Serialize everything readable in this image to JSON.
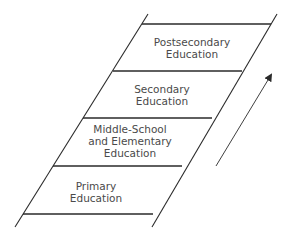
{
  "diagram": {
    "type": "ladder",
    "direction": "upward",
    "stroke_color": "#2a2a2a",
    "text_color": "#4a4a4a",
    "rungs": [
      {
        "label": "Postsecondary\nEducation",
        "level": 4
      },
      {
        "label": "Secondary\nEducation",
        "level": 3
      },
      {
        "label": "Middle-School\nand Elementary\nEducation",
        "level": 2
      },
      {
        "label": "Primary\nEducation",
        "level": 1
      }
    ],
    "arrow": {
      "meaning": "progression upward",
      "icon": "arrow-up-right-icon"
    }
  }
}
